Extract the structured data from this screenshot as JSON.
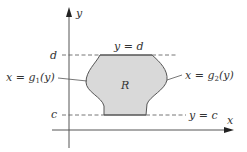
{
  "figure": {
    "axes": {
      "x_label": "x",
      "y_label": "y"
    },
    "region": {
      "label": "R",
      "fill_color": "#d9d9d9",
      "stroke_color": "#555555"
    },
    "bounds": {
      "upper": {
        "tick": "d",
        "line_label": "y = d"
      },
      "lower": {
        "tick": "c",
        "line_label": "y = c"
      }
    },
    "curves": {
      "left": {
        "label_prefix": "x = g",
        "subscript": "1",
        "label_suffix": "(y)"
      },
      "right": {
        "label_prefix": "x = g",
        "subscript": "2",
        "label_suffix": "(y)"
      }
    },
    "colors": {
      "axis": "#555555",
      "dashed": "#666666",
      "text": "#333333"
    }
  }
}
